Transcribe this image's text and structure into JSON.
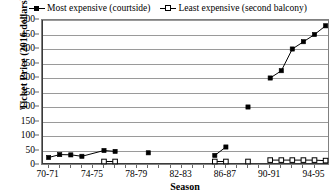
{
  "legend": {
    "position": "top-center",
    "entries": [
      {
        "label": "Most expensive (courtside)",
        "marker": "filled-square-line",
        "color": "#000000"
      },
      {
        "label": "Least expensive (second balcony)",
        "marker": "open-square-line",
        "color": "#000000"
      }
    ]
  },
  "chart_data": {
    "type": "line",
    "title": "",
    "xlabel": "Season",
    "ylabel": "Ticket Price (2016 dollars)",
    "ylim": [
      0,
      500
    ],
    "ytick_step": 50,
    "yticks": [
      0,
      50,
      100,
      150,
      200,
      250,
      300,
      350,
      400,
      450,
      500
    ],
    "grid": true,
    "x_tick_labels": [
      "70-71",
      "74-75",
      "78-79",
      "82-83",
      "86-87",
      "90-91",
      "94-95"
    ],
    "x_tick_label_indices": [
      0,
      4,
      8,
      12,
      16,
      20,
      24
    ],
    "x_categories": [
      "70-71",
      "71-72",
      "72-73",
      "73-74",
      "74-75",
      "75-76",
      "76-77",
      "77-78",
      "78-79",
      "79-80",
      "80-81",
      "81-82",
      "82-83",
      "83-84",
      "84-85",
      "85-86",
      "86-87",
      "87-88",
      "88-89",
      "89-90",
      "90-91",
      "91-92",
      "92-93",
      "93-94",
      "94-95"
    ],
    "series": [
      {
        "name": "Most expensive (courtside)",
        "marker": "filled-square",
        "color": "#000000",
        "points": [
          {
            "x": 0,
            "y": 26
          },
          {
            "x": 1,
            "y": 36
          },
          {
            "x": 2,
            "y": 35
          },
          {
            "x": 3,
            "y": 30
          },
          {
            "x": 5,
            "y": 50
          },
          {
            "x": 6,
            "y": 47
          },
          {
            "x": 9,
            "y": 42
          },
          {
            "x": 15,
            "y": 33
          },
          {
            "x": 16,
            "y": 62
          },
          {
            "x": 18,
            "y": 200
          },
          {
            "x": 20,
            "y": 300
          },
          {
            "x": 21,
            "y": 325
          },
          {
            "x": 22,
            "y": 400
          },
          {
            "x": 23,
            "y": 425
          },
          {
            "x": 24,
            "y": 450
          },
          {
            "x": 25,
            "y": 480
          }
        ],
        "segments": [
          [
            0,
            1,
            2,
            3,
            5,
            6
          ],
          [
            15,
            16
          ],
          [
            20,
            21,
            22,
            23,
            24,
            25
          ]
        ]
      },
      {
        "name": "Least expensive (second balcony)",
        "marker": "open-square",
        "color": "#000000",
        "points": [
          {
            "x": 5,
            "y": 12
          },
          {
            "x": 6,
            "y": 12
          },
          {
            "x": 15,
            "y": 12
          },
          {
            "x": 16,
            "y": 12
          },
          {
            "x": 18,
            "y": 12
          },
          {
            "x": 20,
            "y": 17
          },
          {
            "x": 21,
            "y": 17
          },
          {
            "x": 22,
            "y": 17
          },
          {
            "x": 23,
            "y": 17
          },
          {
            "x": 24,
            "y": 17
          },
          {
            "x": 25,
            "y": 15
          }
        ],
        "segments": [
          [
            5,
            6
          ],
          [
            15,
            16
          ],
          [
            20,
            21,
            22,
            23,
            24,
            25
          ]
        ]
      }
    ]
  }
}
